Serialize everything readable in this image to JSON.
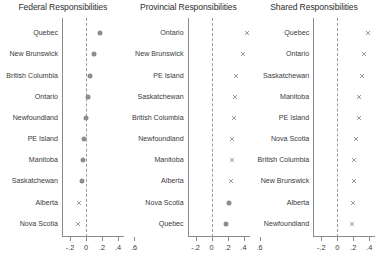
{
  "chart_data": {
    "type": "scatter",
    "title": "",
    "layout": "three horizontal dot-plot panels, shared x-scale",
    "xlabel": "",
    "ylabel": "",
    "xlim": [
      -0.3,
      0.7
    ],
    "xticks": [
      -0.2,
      0,
      0.2,
      0.4,
      0.6
    ],
    "xticklabels": [
      "-.2",
      "0",
      ".2",
      ".4",
      ".6"
    ],
    "grid": false,
    "legend": "none",
    "reference_line": 0,
    "reference_line_style": "dashed",
    "panels": [
      {
        "title": "Federal Responsibilities",
        "categories": [
          "Quebec",
          "New Brunswick",
          "British Columbia",
          "Ontario",
          "Newfoundland",
          "PE Island",
          "Manitoba",
          "Saskatchewan",
          "Alberta",
          "Nova Scotia"
        ],
        "values": [
          0.18,
          0.1,
          0.055,
          0.03,
          0.005,
          -0.03,
          -0.035,
          -0.055,
          -0.085,
          -0.1
        ],
        "markers": [
          "circle",
          "circle",
          "circle",
          "circle",
          "circle",
          "circle",
          "circle",
          "circle",
          "cross",
          "cross"
        ]
      },
      {
        "title": "Provincial Responsibilities",
        "categories": [
          "Ontario",
          "New Brunswick",
          "PE Island",
          "Saskatchewan",
          "British Columbia",
          "Newfoundland",
          "Manitoba",
          "Alberta",
          "Nova Scotia",
          "Quebec"
        ],
        "values": [
          0.44,
          0.39,
          0.3,
          0.29,
          0.275,
          0.26,
          0.25,
          0.24,
          0.215,
          0.185
        ],
        "markers": [
          "cross",
          "cross",
          "cross",
          "cross",
          "cross",
          "cross",
          "cross",
          "cross",
          "circle",
          "circle"
        ]
      },
      {
        "title": "Shared Responsibilities",
        "categories": [
          "Quebec",
          "Ontario",
          "Saskatchewan",
          "Manitoba",
          "PE Island",
          "Nova Scotia",
          "British Columbia",
          "New Brunswick",
          "Alberta",
          "Newfoundland"
        ],
        "values": [
          0.38,
          0.335,
          0.31,
          0.275,
          0.27,
          0.24,
          0.21,
          0.205,
          0.2,
          0.185
        ],
        "markers": [
          "cross",
          "cross",
          "cross",
          "cross",
          "cross",
          "cross",
          "cross",
          "cross",
          "cross",
          "cross"
        ]
      }
    ]
  },
  "colors": {
    "marker": "#8d8d8d",
    "axis": "#8a8a8a",
    "reference_line": "#9b9b9b",
    "text": "#3b3b3b",
    "background": "#ffffff"
  }
}
